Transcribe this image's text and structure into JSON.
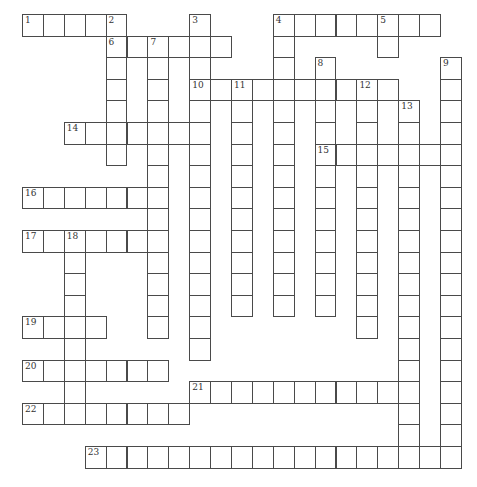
{
  "puzzle": {
    "type": "crossword",
    "grid": {
      "origin_x": 22,
      "origin_y": 14,
      "col_pitch": 20.9,
      "row_pitch": 21.6,
      "line_color": "#4a4a4a",
      "cell_color": "#ffffff"
    },
    "words": [
      {
        "number": "1",
        "dir": "across",
        "row": 0,
        "col": 0,
        "len": 5
      },
      {
        "number": "2",
        "dir": "down",
        "row": 0,
        "col": 4,
        "len": 7
      },
      {
        "number": "3",
        "dir": "down",
        "row": 0,
        "col": 8,
        "len": 16
      },
      {
        "number": "4",
        "dir": "across",
        "row": 0,
        "col": 12,
        "len": 8
      },
      {
        "number": "4",
        "dir": "down",
        "row": 0,
        "col": 12,
        "len": 14
      },
      {
        "number": "5",
        "dir": "down",
        "row": 0,
        "col": 17,
        "len": 2
      },
      {
        "number": "6",
        "dir": "across",
        "row": 1,
        "col": 4,
        "len": 6
      },
      {
        "number": "7",
        "dir": "down",
        "row": 1,
        "col": 6,
        "len": 14
      },
      {
        "number": "8",
        "dir": "down",
        "row": 2,
        "col": 14,
        "len": 12
      },
      {
        "number": "9",
        "dir": "down",
        "row": 2,
        "col": 20,
        "len": 19
      },
      {
        "number": "10",
        "dir": "across",
        "row": 3,
        "col": 8,
        "len": 10
      },
      {
        "number": "11",
        "dir": "down",
        "row": 3,
        "col": 10,
        "len": 11
      },
      {
        "number": "12",
        "dir": "down",
        "row": 3,
        "col": 16,
        "len": 12
      },
      {
        "number": "13",
        "dir": "down",
        "row": 4,
        "col": 18,
        "len": 17
      },
      {
        "number": "14",
        "dir": "across",
        "row": 5,
        "col": 2,
        "len": 7
      },
      {
        "number": "15",
        "dir": "across",
        "row": 6,
        "col": 14,
        "len": 7
      },
      {
        "number": "16",
        "dir": "across",
        "row": 8,
        "col": 0,
        "len": 7
      },
      {
        "number": "17",
        "dir": "across",
        "row": 10,
        "col": 0,
        "len": 7
      },
      {
        "number": "18",
        "dir": "down",
        "row": 10,
        "col": 2,
        "len": 9
      },
      {
        "number": "19",
        "dir": "across",
        "row": 14,
        "col": 0,
        "len": 4
      },
      {
        "number": "20",
        "dir": "across",
        "row": 16,
        "col": 0,
        "len": 7
      },
      {
        "number": "21",
        "dir": "across",
        "row": 17,
        "col": 8,
        "len": 11
      },
      {
        "number": "22",
        "dir": "across",
        "row": 18,
        "col": 0,
        "len": 8
      },
      {
        "number": "23",
        "dir": "across",
        "row": 20,
        "col": 3,
        "len": 18
      }
    ]
  }
}
